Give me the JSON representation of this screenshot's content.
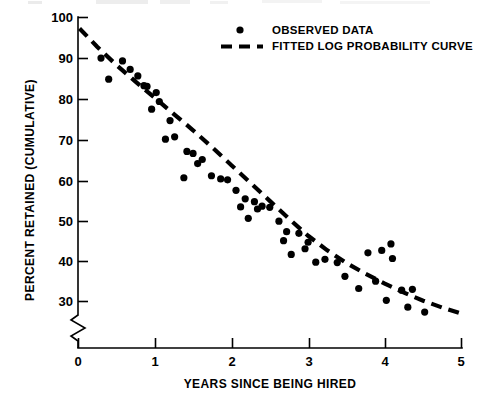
{
  "chart_data": {
    "type": "scatter",
    "title": "",
    "xlabel": "YEARS SINCE BEING HIRED",
    "ylabel": "PERCENT RETAINED (CUMULATIVE)",
    "xlim": [
      0,
      5
    ],
    "ylim": [
      26,
      100
    ],
    "xticks": [
      "0",
      "1",
      "2",
      "3",
      "4",
      "5"
    ],
    "xtick_values": [
      0,
      1,
      2,
      3,
      4,
      5
    ],
    "yticks": [
      "30",
      "40",
      "50",
      "60",
      "70",
      "80",
      "90",
      "100"
    ],
    "ytick_values": [
      30,
      40,
      50,
      60,
      70,
      80,
      90,
      100
    ],
    "grid": false,
    "y_axis_break": true,
    "y_axis_break_note": "axis break below 30",
    "legend_position": "top-right",
    "series": [
      {
        "name": "OBSERVED DATA",
        "type": "scatter",
        "marker": "filled-circle",
        "color": "#000000",
        "points": [
          [
            0.3,
            90.0
          ],
          [
            0.4,
            84.8
          ],
          [
            0.58,
            89.3
          ],
          [
            0.68,
            87.2
          ],
          [
            0.78,
            85.6
          ],
          [
            0.86,
            83.2
          ],
          [
            0.9,
            83.0
          ],
          [
            1.02,
            81.5
          ],
          [
            1.06,
            79.3
          ],
          [
            0.96,
            77.4
          ],
          [
            1.2,
            74.6
          ],
          [
            1.26,
            70.6
          ],
          [
            1.14,
            70.0
          ],
          [
            1.42,
            67.0
          ],
          [
            1.5,
            66.5
          ],
          [
            1.56,
            64.0
          ],
          [
            1.62,
            65.0
          ],
          [
            1.38,
            60.5
          ],
          [
            1.74,
            61.0
          ],
          [
            1.86,
            60.2
          ],
          [
            1.95,
            60.0
          ],
          [
            2.06,
            57.4
          ],
          [
            2.18,
            55.3
          ],
          [
            2.12,
            53.3
          ],
          [
            2.3,
            54.6
          ],
          [
            2.4,
            53.5
          ],
          [
            2.34,
            52.8
          ],
          [
            2.5,
            53.2
          ],
          [
            2.22,
            50.5
          ],
          [
            2.62,
            49.8
          ],
          [
            2.72,
            47.2
          ],
          [
            2.88,
            46.8
          ],
          [
            2.68,
            45.0
          ],
          [
            3.0,
            44.6
          ],
          [
            2.96,
            43.0
          ],
          [
            2.78,
            41.6
          ],
          [
            3.1,
            39.7
          ],
          [
            3.22,
            40.4
          ],
          [
            3.38,
            39.6
          ],
          [
            3.48,
            36.2
          ],
          [
            3.66,
            33.2
          ],
          [
            3.78,
            42.0
          ],
          [
            3.96,
            42.6
          ],
          [
            4.08,
            44.2
          ],
          [
            4.1,
            40.6
          ],
          [
            3.88,
            35.0
          ],
          [
            4.02,
            30.3
          ],
          [
            4.22,
            32.8
          ],
          [
            4.36,
            33.0
          ],
          [
            4.3,
            28.6
          ],
          [
            4.52,
            27.4
          ]
        ]
      },
      {
        "name": "FITTED LOG PROBABILITY CURVE",
        "type": "line",
        "style": "dashed",
        "color": "#000000",
        "points": [
          [
            0.02,
            97.3
          ],
          [
            0.25,
            92.8
          ],
          [
            0.5,
            88.3
          ],
          [
            0.75,
            84.2
          ],
          [
            1.0,
            80.2
          ],
          [
            1.25,
            76.2
          ],
          [
            1.5,
            72.2
          ],
          [
            1.75,
            68.0
          ],
          [
            2.0,
            63.6
          ],
          [
            2.25,
            59.2
          ],
          [
            2.5,
            54.8
          ],
          [
            2.75,
            50.4
          ],
          [
            3.0,
            46.2
          ],
          [
            3.25,
            42.6
          ],
          [
            3.5,
            39.5
          ],
          [
            3.75,
            36.8
          ],
          [
            4.0,
            34.4
          ],
          [
            4.25,
            32.2
          ],
          [
            4.5,
            30.2
          ],
          [
            4.75,
            28.5
          ],
          [
            5.0,
            27.0
          ]
        ]
      }
    ]
  },
  "legend": {
    "items": [
      {
        "label": "OBSERVED DATA",
        "marker": "dot"
      },
      {
        "label": "FITTED LOG PROBABILITY CURVE",
        "marker": "dashed-line"
      }
    ]
  }
}
